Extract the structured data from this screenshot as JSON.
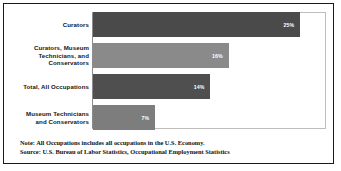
{
  "chart_data": {
    "type": "bar",
    "orientation": "horizontal",
    "title": "",
    "subtitle": "",
    "xlabel": "",
    "ylabel": "",
    "categories": [
      "Curators",
      "Curators, Museum Technicians, and Conservators",
      "Total, All Occupations",
      "Museum Technicians and Conservators"
    ],
    "values": [
      25,
      16,
      14,
      7
    ],
    "value_labels": [
      "25%",
      "16%",
      "14%",
      "7%"
    ],
    "xlim": [
      0,
      28
    ],
    "grid": false,
    "legend": null,
    "bar_colors": [
      "#4a4a4a",
      "#8a8a8a",
      "#4f4f4f",
      "#7d7d7d"
    ],
    "annotations": [
      "Note: All Occupations includes all occupations in the U.S. Economy.",
      "Source: U.S. Bureau of Labor Statistics, Occupational Employment Statistics"
    ]
  },
  "bars": [
    {
      "label_line1": "Curators",
      "label_line2": "",
      "label_line3": "",
      "value_label": "25%",
      "width_pct": "89.3",
      "color": "#4a4a4a"
    },
    {
      "label_line1": "Curators, Museum",
      "label_line2": "Technicians, and",
      "label_line3": "Conservators",
      "value_label": "16%",
      "width_pct": "58.5",
      "color": "#8a8a8a"
    },
    {
      "label_line1": "Total, All Occupations",
      "label_line2": "",
      "label_line3": "",
      "value_label": "14%",
      "width_pct": "50.6",
      "color": "#4f4f4f"
    },
    {
      "label_line1": "Museum Technicians",
      "label_line2": "and Conservators",
      "label_line3": "",
      "value_label": "7%",
      "width_pct": "26.8",
      "color": "#7d7d7d"
    }
  ],
  "notes": {
    "note": "Note: All Occupations includes all occupations in the U.S. Economy.",
    "source": "Source: U.S. Bureau of Labor Statistics, Occupational Employment Statistics"
  }
}
